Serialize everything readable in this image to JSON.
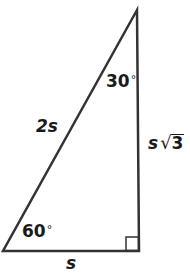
{
  "diagram": {
    "type": "right-triangle",
    "stroke_color": "#333333",
    "vertices": {
      "top": [
        137,
        10
      ],
      "bottom_left": [
        3,
        251
      ],
      "bottom_right": [
        139,
        251
      ]
    },
    "angles": {
      "top": {
        "value": "30",
        "unit": "°"
      },
      "bottom_left": {
        "value": "60",
        "unit": "°"
      },
      "bottom_right": {
        "marker": "right-angle"
      }
    },
    "sides": {
      "hypotenuse": "2s",
      "short_leg": "s",
      "long_leg_var": "s",
      "long_leg_radical": "√",
      "long_leg_radicand": "3"
    }
  }
}
